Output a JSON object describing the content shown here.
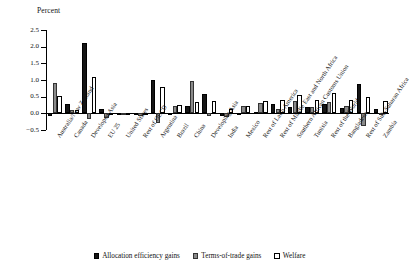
{
  "chart_data": {
    "type": "bar",
    "title": "",
    "xlabel": "",
    "ylabel": "Percent",
    "ylim": [
      -0.5,
      2.5
    ],
    "yticks": [
      2.5,
      2.0,
      1.5,
      1.0,
      0.5,
      0.0,
      -0.5
    ],
    "ytick_labels": [
      "2.5",
      "2.0",
      "1.5",
      "1.0",
      "0.5",
      "0.0",
      "−0.5"
    ],
    "grid": false,
    "legend_position": "bottom",
    "categories": [
      "Australia/New Zealand",
      "Canada",
      "Developed Asia",
      "EU 25",
      "United States",
      "Rest of OECD",
      "Argentina",
      "Brazil",
      "China",
      "Developing Asia",
      "India",
      "Mexico",
      "Rest of Latin America",
      "Rest of Middle East and North Africa",
      "Southern African Customs Union",
      "Tunisia",
      "Rest of the World",
      "Bangladesh",
      "Rest of Sub-Saharan Africa",
      "Zambia"
    ],
    "series": [
      {
        "name": "Allocation efficiency gains",
        "color": "#151515",
        "values": [
          -0.07,
          0.27,
          2.12,
          0.13,
          -0.01,
          -0.03,
          1.01,
          0.02,
          0.22,
          0.57,
          -0.08,
          0.02,
          0.05,
          0.27,
          0.18,
          0.19,
          0.27,
          0.15,
          0.88,
          0.13
        ]
      },
      {
        "name": "Terms-of-trade gains",
        "color": "#8a8a8a",
        "values": [
          0.9,
          0.1,
          -0.17,
          -0.13,
          -0.01,
          -0.07,
          -0.29,
          0.23,
          0.97,
          -0.07,
          -0.1,
          0.21,
          0.3,
          0.14,
          0.36,
          0.19,
          0.35,
          0.23,
          -0.37,
          0.02
        ]
      },
      {
        "name": "Welfare",
        "color": "#ffffff",
        "values": [
          0.51,
          0.09,
          1.09,
          -0.01,
          -0.02,
          -0.02,
          0.78,
          0.24,
          0.35,
          0.38,
          0.13,
          0.22,
          0.37,
          0.4,
          0.56,
          0.4,
          0.61,
          0.4,
          0.49,
          0.37
        ]
      }
    ]
  },
  "legend": {
    "items": [
      {
        "label": "Allocation efficiency gains"
      },
      {
        "label": "Terms-of-trade gains"
      },
      {
        "label": "Welfare"
      }
    ]
  }
}
